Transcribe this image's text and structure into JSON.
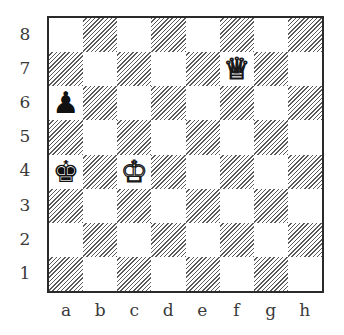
{
  "board": {
    "files": [
      "a",
      "b",
      "c",
      "d",
      "e",
      "f",
      "g",
      "h"
    ],
    "ranks": [
      "8",
      "7",
      "6",
      "5",
      "4",
      "3",
      "2",
      "1"
    ],
    "colors": {
      "light_square": "#ffffff",
      "dark_square_hatch": "#5a5a5a",
      "border": "#2a2a2a",
      "label": "#3a3a3a"
    },
    "pieces": [
      {
        "square": "f7",
        "color": "white",
        "type": "queen",
        "glyph": "♕",
        "name": "white-queen-icon"
      },
      {
        "square": "a6",
        "color": "black",
        "type": "pawn",
        "glyph": "♟",
        "name": "black-pawn-icon"
      },
      {
        "square": "a4",
        "color": "black",
        "type": "king",
        "glyph": "♚",
        "name": "black-king-icon"
      },
      {
        "square": "c4",
        "color": "white",
        "type": "king",
        "glyph": "♔",
        "name": "white-king-icon"
      }
    ]
  }
}
